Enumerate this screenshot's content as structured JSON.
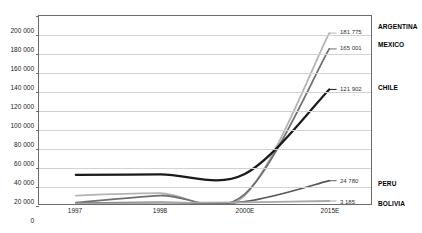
{
  "chart_data": {
    "type": "line",
    "title": "",
    "xlabel": "",
    "ylabel": "",
    "x": [
      "1997",
      "1998",
      "2000E",
      "2015E"
    ],
    "categories": [
      "1997",
      "1998",
      "2000E",
      "2015E"
    ],
    "ylim": [
      0,
      200000
    ],
    "yticks": [
      0,
      20000,
      40000,
      60000,
      80000,
      100000,
      120000,
      140000,
      160000,
      180000,
      200000
    ],
    "ytick_labels": [
      "0",
      "20 000",
      "40 000",
      "60 000",
      "80 000",
      "100 000",
      "120 000",
      "140 000",
      "160 000",
      "180 000",
      "200 000"
    ],
    "grid": true,
    "legend_position": "right",
    "series": [
      {
        "name": "ARGENTINA",
        "color": "#b4b4b4",
        "values": [
          9000,
          11500,
          9000,
          181775
        ],
        "end_value": 181775,
        "end_label": "181 775"
      },
      {
        "name": "MEXICO",
        "color": "#707070",
        "values": [
          1500,
          9000,
          10500,
          165001
        ],
        "end_value": 165001,
        "end_label": "165 001"
      },
      {
        "name": "CHILE",
        "color": "#1a1a1a",
        "values": [
          31000,
          31500,
          32000,
          121902
        ],
        "end_value": 121902,
        "end_label": "121 902"
      },
      {
        "name": "PERU",
        "color": "#585858",
        "values": [
          1000,
          1800,
          2500,
          24780
        ],
        "end_value": 24780,
        "end_label": "24 780"
      },
      {
        "name": "BOLIVIA",
        "color": "#a8a8a8",
        "values": [
          700,
          1200,
          1800,
          3185
        ],
        "end_value": 3185,
        "end_label": "3 185"
      }
    ]
  },
  "colors": {
    "axis": "#6b6b6b",
    "gridline": "#d2d2d2",
    "background": "#ffffff",
    "text": "#222222"
  }
}
